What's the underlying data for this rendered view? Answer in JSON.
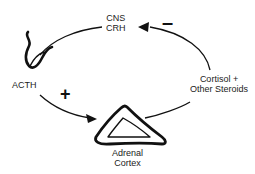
{
  "diagram": {
    "nodes": {
      "cns": {
        "line1": "CNS",
        "line2": "CRH"
      },
      "acth": {
        "label": "ACTH"
      },
      "adrenal": {
        "line1": "Adrenal",
        "line2": "Cortex"
      },
      "cortisol": {
        "line1": "Cortisol +",
        "line2": "Other Steroids"
      }
    },
    "signs": {
      "stimulate": "+",
      "inhibit": "–"
    },
    "edges": [
      {
        "from": "CNS CRH",
        "to": "ACTH",
        "effect": "release"
      },
      {
        "from": "ACTH",
        "to": "Adrenal Cortex",
        "effect": "+"
      },
      {
        "from": "Adrenal Cortex",
        "to": "Cortisol + Other Steroids",
        "effect": "release"
      },
      {
        "from": "Cortisol + Other Steroids",
        "to": "CNS CRH",
        "effect": "–"
      }
    ]
  }
}
